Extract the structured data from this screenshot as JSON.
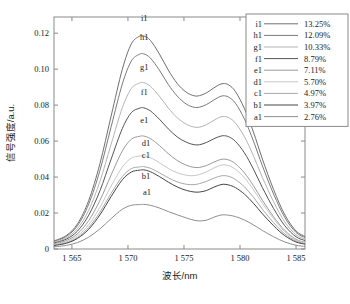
{
  "chart_data": {
    "type": "line",
    "title": "",
    "xlabel": "波长/nm",
    "ylabel": "信号强度/a.u.",
    "xlim": [
      1563.4,
      1585.8
    ],
    "ylim": [
      0,
      0.129
    ],
    "xticks": [
      "1 565",
      "1 570",
      "1 575",
      "1 580",
      "1 585"
    ],
    "xtick_values": [
      1565,
      1570,
      1575,
      1580,
      1585
    ],
    "yticks": [
      "0",
      "0.02",
      "0.04",
      "0.06",
      "0.08",
      "0.10",
      "0.12"
    ],
    "ytick_values": [
      0,
      0.02,
      0.04,
      0.06,
      0.08,
      0.1,
      0.12
    ],
    "grid": false,
    "legend_position": "top-right",
    "x": [
      1563.4,
      1564.5,
      1565.5,
      1566.5,
      1567.5,
      1568.5,
      1569.5,
      1570.3,
      1571.0,
      1571.4,
      1572.0,
      1572.8,
      1573.6,
      1574.4,
      1575.2,
      1575.9,
      1576.4,
      1577.0,
      1577.6,
      1578.1,
      1578.5,
      1579.0,
      1579.6,
      1580.4,
      1581.2,
      1582.0,
      1583.0,
      1584.0,
      1585.0,
      1585.8
    ],
    "series": [
      {
        "name": "i1",
        "label": "13.25%",
        "color": "#6f6f6f",
        "peak1": 0.1185,
        "peak2": 0.092,
        "valley": 0.085,
        "values": [
          0.0045,
          0.0075,
          0.014,
          0.027,
          0.0475,
          0.074,
          0.1,
          0.114,
          0.1182,
          0.1185,
          0.116,
          0.1085,
          0.0995,
          0.092,
          0.0872,
          0.0852,
          0.0853,
          0.0868,
          0.0893,
          0.0912,
          0.092,
          0.0912,
          0.0875,
          0.078,
          0.065,
          0.05,
          0.033,
          0.019,
          0.01,
          0.007
        ]
      },
      {
        "name": "h1",
        "label": "12.09%",
        "color": "#7a7a7a",
        "peak1": 0.1085,
        "peak2": 0.0852,
        "valley": 0.0786,
        "values": [
          0.0042,
          0.007,
          0.013,
          0.025,
          0.0437,
          0.068,
          0.0918,
          0.1045,
          0.1082,
          0.1085,
          0.1062,
          0.0995,
          0.0915,
          0.085,
          0.0806,
          0.0788,
          0.0789,
          0.0803,
          0.0826,
          0.0844,
          0.0852,
          0.0844,
          0.081,
          0.0722,
          0.06,
          0.0462,
          0.0305,
          0.0175,
          0.0092,
          0.0064
        ]
      },
      {
        "name": "g1",
        "label": "10.33%",
        "color": "#b4b4b4",
        "peak1": 0.0925,
        "peak2": 0.0737,
        "valley": 0.0675,
        "values": [
          0.0037,
          0.0062,
          0.0114,
          0.0216,
          0.0376,
          0.0583,
          0.0786,
          0.0892,
          0.0922,
          0.0925,
          0.0905,
          0.085,
          0.0784,
          0.073,
          0.0694,
          0.0678,
          0.0678,
          0.0691,
          0.0713,
          0.073,
          0.0737,
          0.073,
          0.07,
          0.0624,
          0.0518,
          0.0398,
          0.0262,
          0.015,
          0.0079,
          0.0055
        ]
      },
      {
        "name": "f1",
        "label": "8.79%",
        "color": "#555555",
        "peak1": 0.0785,
        "peak2": 0.063,
        "valley": 0.0578,
        "values": [
          0.0033,
          0.0055,
          0.01,
          0.0188,
          0.0324,
          0.05,
          0.067,
          0.0758,
          0.0782,
          0.0785,
          0.0768,
          0.0722,
          0.0668,
          0.0623,
          0.0594,
          0.058,
          0.058,
          0.0592,
          0.0611,
          0.0624,
          0.063,
          0.0624,
          0.0598,
          0.0534,
          0.0444,
          0.0341,
          0.0225,
          0.0129,
          0.0068,
          0.0047
        ]
      },
      {
        "name": "e1",
        "label": "7.11%",
        "color": "#9a9a9a",
        "peak1": 0.0628,
        "peak2": 0.05,
        "valley": 0.0452,
        "values": [
          0.0028,
          0.0047,
          0.0085,
          0.0158,
          0.027,
          0.0412,
          0.0545,
          0.061,
          0.0626,
          0.0628,
          0.0614,
          0.0576,
          0.053,
          0.0492,
          0.0466,
          0.0454,
          0.0454,
          0.0464,
          0.0481,
          0.0494,
          0.05,
          0.0495,
          0.0474,
          0.0423,
          0.0352,
          0.0271,
          0.0179,
          0.0103,
          0.0054,
          0.0037
        ]
      },
      {
        "name": "d1",
        "label": "5.70%",
        "color": "#c8c8c8",
        "peak1": 0.0518,
        "peak2": 0.0468,
        "valley": 0.041,
        "values": [
          0.0024,
          0.004,
          0.0073,
          0.0136,
          0.0232,
          0.035,
          0.0456,
          0.0505,
          0.0516,
          0.0518,
          0.0508,
          0.048,
          0.0448,
          0.0424,
          0.041,
          0.0408,
          0.0415,
          0.0429,
          0.0448,
          0.0462,
          0.0468,
          0.0463,
          0.0443,
          0.0396,
          0.033,
          0.0254,
          0.0168,
          0.0096,
          0.005,
          0.0035
        ]
      },
      {
        "name": "c1",
        "label": "4.97%",
        "color": "#a8a8a8",
        "peak1": 0.0458,
        "peak2": 0.0408,
        "valley": 0.0358,
        "values": [
          0.0021,
          0.0035,
          0.0064,
          0.012,
          0.0205,
          0.031,
          0.0403,
          0.0447,
          0.0456,
          0.0458,
          0.0449,
          0.0424,
          0.0396,
          0.0373,
          0.036,
          0.0358,
          0.0364,
          0.0376,
          0.0392,
          0.0403,
          0.0408,
          0.0404,
          0.0386,
          0.0345,
          0.0288,
          0.0221,
          0.0146,
          0.0084,
          0.0044,
          0.003
        ]
      },
      {
        "name": "b1",
        "label": "3.97%",
        "color": "#454545",
        "peak1": 0.044,
        "peak2": 0.036,
        "valley": 0.0315,
        "values": [
          0.0019,
          0.0032,
          0.0059,
          0.011,
          0.019,
          0.0292,
          0.0385,
          0.0428,
          0.0438,
          0.044,
          0.043,
          0.0403,
          0.0372,
          0.0345,
          0.0326,
          0.0317,
          0.0317,
          0.0325,
          0.0342,
          0.0354,
          0.036,
          0.0356,
          0.0341,
          0.0305,
          0.0254,
          0.0196,
          0.0129,
          0.0074,
          0.0039,
          0.0027
        ]
      },
      {
        "name": "a1",
        "label": "2.76%",
        "color": "#8f8f8f",
        "peak1": 0.0248,
        "peak2": 0.019,
        "valley": 0.0155,
        "values": [
          0.0012,
          0.002,
          0.0036,
          0.0066,
          0.0112,
          0.0169,
          0.0221,
          0.0243,
          0.0247,
          0.0248,
          0.0243,
          0.0228,
          0.0208,
          0.019,
          0.0173,
          0.016,
          0.0156,
          0.016,
          0.0175,
          0.0186,
          0.019,
          0.0188,
          0.018,
          0.0161,
          0.0134,
          0.0103,
          0.0068,
          0.0039,
          0.0021,
          0.0014
        ]
      }
    ]
  },
  "legend": {
    "entries": [
      {
        "name": "i1",
        "value": "13.25%"
      },
      {
        "name": "h1",
        "value": "12.09%"
      },
      {
        "name": "g1",
        "value": "10.33%"
      },
      {
        "name": "f1",
        "value": "8.79%"
      },
      {
        "name": "e1",
        "value": "7.11%"
      },
      {
        "name": "d1",
        "value": "5.70%"
      },
      {
        "name": "c1",
        "value": "4.97%"
      },
      {
        "name": "b1",
        "value": "3.97%"
      },
      {
        "name": "a1",
        "value": "2.76%"
      }
    ]
  },
  "curve_labels": [
    {
      "name": "i1",
      "x": 1571.45,
      "y": 0.1265
    },
    {
      "name": "h1",
      "x": 1571.45,
      "y": 0.116
    },
    {
      "name": "g1",
      "x": 1571.45,
      "y": 0.0997
    },
    {
      "name": "f1",
      "x": 1571.45,
      "y": 0.0855
    },
    {
      "name": "e1",
      "x": 1571.45,
      "y": 0.07
    },
    {
      "name": "d1",
      "x": 1571.6,
      "y": 0.057
    },
    {
      "name": "c1",
      "x": 1571.6,
      "y": 0.0505
    },
    {
      "name": "b1",
      "x": 1571.6,
      "y": 0.039
    },
    {
      "name": "a1",
      "x": 1571.7,
      "y": 0.03
    }
  ]
}
